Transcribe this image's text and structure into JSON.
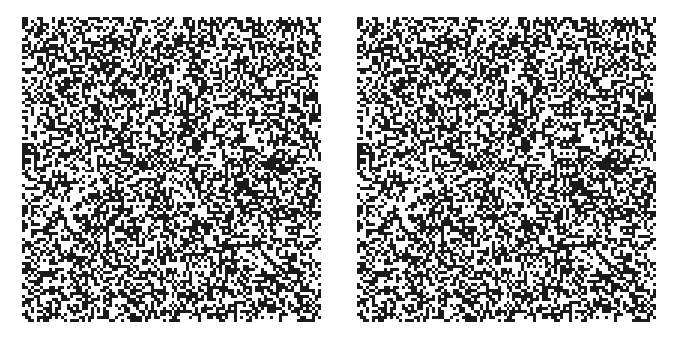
{
  "figure": {
    "type": "random-dot-stereogram",
    "panels": [
      {
        "id": "left",
        "label": ""
      },
      {
        "id": "right",
        "label": ""
      }
    ],
    "grid": {
      "cols": 100,
      "rows": 102,
      "density": 0.5
    },
    "colors": {
      "dot": "#1a1a1a",
      "background": "#ffffff"
    }
  }
}
